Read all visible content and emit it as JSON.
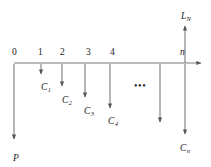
{
  "figure": {
    "type": "cash-flow-timeline",
    "axis": {
      "label_right_end": "",
      "y": 63,
      "x_start": 14,
      "x_end": 205
    },
    "stroke_color": "#6f6f6f",
    "text_color": "#1a1a1a",
    "tick_labels": [
      {
        "name": "tick-0",
        "text": "0",
        "x": 12,
        "y": 48,
        "italic": false
      },
      {
        "name": "tick-1",
        "text": "1",
        "x": 38,
        "y": 48,
        "italic": false
      },
      {
        "name": "tick-2",
        "text": "2",
        "x": 60,
        "y": 48,
        "italic": false
      },
      {
        "name": "tick-3",
        "text": "3",
        "x": 86,
        "y": 48,
        "italic": false
      },
      {
        "name": "tick-4",
        "text": "4",
        "x": 110,
        "y": 48,
        "italic": false
      },
      {
        "name": "tick-n",
        "text": "n",
        "x": 180,
        "y": 48,
        "italic": true
      }
    ],
    "cash_flows": [
      {
        "name": "c1",
        "base": "C",
        "sub": "1",
        "x": 41,
        "y": 83
      },
      {
        "name": "c2",
        "base": "C",
        "sub": "2",
        "x": 62,
        "y": 96
      },
      {
        "name": "c3",
        "base": "C",
        "sub": "3",
        "x": 84,
        "y": 107
      },
      {
        "name": "c4",
        "base": "C",
        "sub": "4",
        "x": 108,
        "y": 117
      },
      {
        "name": "cn",
        "base": "C",
        "sub": "n",
        "x": 180,
        "y": 144
      }
    ],
    "principal": {
      "name": "P",
      "text": "P",
      "x": 13,
      "y": 154
    },
    "salvage": {
      "name": "L",
      "base": "L",
      "sub": "N",
      "x": 181,
      "y": 12
    },
    "ellipsis": {
      "text": "•••",
      "x": 134,
      "y": 80
    },
    "down_arrows": [
      {
        "name": "arrow-c1",
        "x": 41,
        "y1": 64,
        "y2": 78
      },
      {
        "name": "arrow-c2",
        "x": 62,
        "y1": 64,
        "y2": 90
      },
      {
        "name": "arrow-c3",
        "x": 85,
        "y1": 64,
        "y2": 101
      },
      {
        "name": "arrow-c4",
        "x": 110,
        "y1": 64,
        "y2": 112
      },
      {
        "name": "arrow-mid",
        "x": 160,
        "y1": 64,
        "y2": 126
      },
      {
        "name": "arrow-cn",
        "x": 185,
        "y1": 64,
        "y2": 138
      },
      {
        "name": "arrow-p",
        "x": 14,
        "y1": 64,
        "y2": 143
      }
    ],
    "up_arrows": [
      {
        "name": "arrow-ln",
        "x": 185,
        "y1": 63,
        "y2": 22
      }
    ]
  }
}
